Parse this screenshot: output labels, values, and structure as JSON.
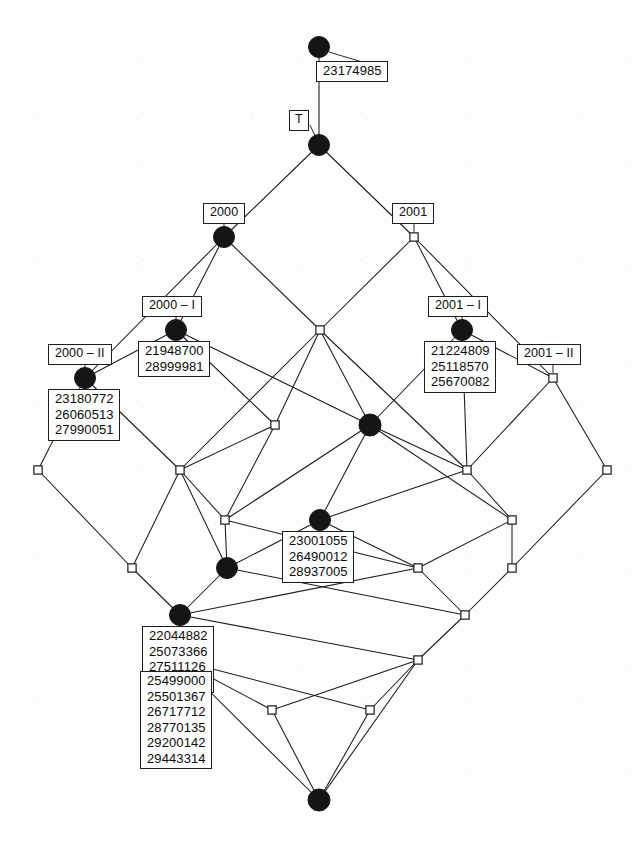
{
  "diagram": {
    "kind": "concept-lattice-hasse-diagram",
    "width": 637,
    "height": 848,
    "colors": {
      "background": "#fdfdfd",
      "edge": "#1a1a1a",
      "node_filled": "#151515",
      "node_open": "#ffffff",
      "label_border": "#1d1d1d",
      "label_text": "#0b0b0b"
    }
  },
  "labels": {
    "top_object": "23174985",
    "top_attribute": "T",
    "attr_2000": "2000",
    "attr_2001": "2001",
    "attr_2000_I": "2000 – I",
    "attr_2000_II": "2000 – II",
    "attr_2001_I": "2001 – I",
    "attr_2001_II": "2001 – II",
    "obj_2000_I": "21948700\n28999981",
    "obj_2000_II": "23180772\n26060513\n27990051",
    "obj_2001_I": "21224809\n25118570\n25670082",
    "obj_center": "23001055\n26490012\n28937005",
    "obj_lower_left": "22044882\n25073366\n27511126\n28853107",
    "obj_bottom_left": "25499000\n25501367\n26717712\n28770135\n29200142\n29443314"
  },
  "nodes": [
    {
      "id": "n-top",
      "x": 319,
      "y": 47,
      "style": "filled",
      "r": 10.5
    },
    {
      "id": "n-unit",
      "x": 319,
      "y": 145,
      "style": "filled",
      "r": 10.5
    },
    {
      "id": "n-2000",
      "x": 224,
      "y": 237,
      "style": "filled",
      "r": 10.5
    },
    {
      "id": "n-2001",
      "x": 414,
      "y": 237,
      "style": "open",
      "r": 5.0
    },
    {
      "id": "n-2000-I",
      "x": 176,
      "y": 330,
      "style": "filled",
      "r": 10.5
    },
    {
      "id": "n-mid-a",
      "x": 320,
      "y": 330,
      "style": "open",
      "r": 5.0
    },
    {
      "id": "n-2001-I",
      "x": 462,
      "y": 330,
      "style": "filled",
      "r": 10.5
    },
    {
      "id": "n-2000-II",
      "x": 85,
      "y": 378,
      "style": "filled",
      "r": 10.5
    },
    {
      "id": "n-2001-II",
      "x": 553,
      "y": 378,
      "style": "open",
      "r": 5.0
    },
    {
      "id": "n-r4-a",
      "x": 275,
      "y": 425,
      "style": "open",
      "r": 5.0
    },
    {
      "id": "n-r4-b",
      "x": 370,
      "y": 425,
      "style": "filled",
      "r": 11.0
    },
    {
      "id": "n-r5-a",
      "x": 38,
      "y": 470,
      "style": "open",
      "r": 5.0
    },
    {
      "id": "n-r5-b",
      "x": 180,
      "y": 470,
      "style": "open",
      "r": 5.0
    },
    {
      "id": "n-r5-c",
      "x": 467,
      "y": 470,
      "style": "open",
      "r": 5.0
    },
    {
      "id": "n-r5-d",
      "x": 607,
      "y": 470,
      "style": "open",
      "r": 5.0
    },
    {
      "id": "n-r6-a",
      "x": 225,
      "y": 520,
      "style": "open",
      "r": 5.0
    },
    {
      "id": "n-r6-b",
      "x": 320,
      "y": 520,
      "style": "filled",
      "r": 10.5
    },
    {
      "id": "n-r6-c",
      "x": 512,
      "y": 520,
      "style": "open",
      "r": 5.0
    },
    {
      "id": "n-r7-a",
      "x": 132,
      "y": 568,
      "style": "open",
      "r": 5.0
    },
    {
      "id": "n-r7-b",
      "x": 227,
      "y": 568,
      "style": "filled",
      "r": 10.5
    },
    {
      "id": "n-r7-c",
      "x": 418,
      "y": 568,
      "style": "open",
      "r": 5.0
    },
    {
      "id": "n-r7-d",
      "x": 512,
      "y": 568,
      "style": "open",
      "r": 5.0
    },
    {
      "id": "n-r8-a",
      "x": 180,
      "y": 615,
      "style": "filled",
      "r": 10.5
    },
    {
      "id": "n-r8-b",
      "x": 465,
      "y": 615,
      "style": "open",
      "r": 5.0
    },
    {
      "id": "n-r9-a",
      "x": 178,
      "y": 660,
      "style": "filled",
      "r": 10.5
    },
    {
      "id": "n-r9-b",
      "x": 418,
      "y": 660,
      "style": "open",
      "r": 5.0
    },
    {
      "id": "n-r10-a",
      "x": 272,
      "y": 710,
      "style": "open",
      "r": 5.0
    },
    {
      "id": "n-r10-b",
      "x": 370,
      "y": 710,
      "style": "open",
      "r": 5.0
    },
    {
      "id": "n-bottom",
      "x": 319,
      "y": 800,
      "style": "filled",
      "r": 11.0
    }
  ],
  "edges": [
    [
      "n-top",
      "n-unit"
    ],
    [
      "n-unit",
      "n-2000"
    ],
    [
      "n-unit",
      "n-2001"
    ],
    [
      "n-2000",
      "n-2000-I"
    ],
    [
      "n-2000",
      "n-2000-II"
    ],
    [
      "n-2000",
      "n-mid-a"
    ],
    [
      "n-2001",
      "n-mid-a"
    ],
    [
      "n-2001",
      "n-2001-I"
    ],
    [
      "n-2001",
      "n-2001-II"
    ],
    [
      "n-2000-I",
      "n-2000-II"
    ],
    [
      "n-2000-I",
      "n-r4-a"
    ],
    [
      "n-2000-I",
      "n-r4-b"
    ],
    [
      "n-mid-a",
      "n-r4-a"
    ],
    [
      "n-mid-a",
      "n-r4-b"
    ],
    [
      "n-mid-a",
      "n-r5-b"
    ],
    [
      "n-mid-a",
      "n-r5-c"
    ],
    [
      "n-2001-I",
      "n-2001-II"
    ],
    [
      "n-2001-I",
      "n-r4-b"
    ],
    [
      "n-2001-I",
      "n-r5-c"
    ],
    [
      "n-2000-II",
      "n-r5-a"
    ],
    [
      "n-2000-II",
      "n-r5-b"
    ],
    [
      "n-2001-II",
      "n-r5-c"
    ],
    [
      "n-2001-II",
      "n-r5-d"
    ],
    [
      "n-r4-a",
      "n-r5-b"
    ],
    [
      "n-r4-a",
      "n-r6-a"
    ],
    [
      "n-r4-b",
      "n-r6-a"
    ],
    [
      "n-r4-b",
      "n-r6-b"
    ],
    [
      "n-r4-b",
      "n-r5-c"
    ],
    [
      "n-r4-b",
      "n-r6-c"
    ],
    [
      "n-r5-a",
      "n-r7-a"
    ],
    [
      "n-r5-b",
      "n-r6-a"
    ],
    [
      "n-r5-b",
      "n-r7-a"
    ],
    [
      "n-r5-b",
      "n-r7-b"
    ],
    [
      "n-r5-c",
      "n-r6-b"
    ],
    [
      "n-r5-c",
      "n-r6-c"
    ],
    [
      "n-r5-d",
      "n-r7-d"
    ],
    [
      "n-r6-a",
      "n-r7-b"
    ],
    [
      "n-r6-a",
      "n-r7-c"
    ],
    [
      "n-r6-b",
      "n-r7-b"
    ],
    [
      "n-r6-b",
      "n-r7-c"
    ],
    [
      "n-r6-c",
      "n-r7-c"
    ],
    [
      "n-r6-c",
      "n-r7-d"
    ],
    [
      "n-r7-a",
      "n-r8-a"
    ],
    [
      "n-r7-b",
      "n-r8-a"
    ],
    [
      "n-r7-b",
      "n-r8-b"
    ],
    [
      "n-r7-c",
      "n-r8-a"
    ],
    [
      "n-r7-c",
      "n-r8-b"
    ],
    [
      "n-r7-d",
      "n-r8-b"
    ],
    [
      "n-r8-a",
      "n-r9-a"
    ],
    [
      "n-r8-a",
      "n-r9-b"
    ],
    [
      "n-r8-b",
      "n-r9-b"
    ],
    [
      "n-r9-a",
      "n-r10-a"
    ],
    [
      "n-r9-a",
      "n-r10-b"
    ],
    [
      "n-r9-b",
      "n-r10-a"
    ],
    [
      "n-r9-b",
      "n-r10-b"
    ],
    [
      "n-r9-a",
      "n-bottom"
    ],
    [
      "n-r10-a",
      "n-bottom"
    ],
    [
      "n-r10-b",
      "n-bottom"
    ],
    [
      "n-r9-b",
      "n-bottom"
    ]
  ],
  "label_boxes": [
    {
      "id": "lb-top-object",
      "text_key": "top_object",
      "kind": "obj",
      "x": 316,
      "y": 61,
      "leader_from": [
        329,
        52
      ],
      "leader_to": [
        382,
        68
      ]
    },
    {
      "id": "lb-top-attr",
      "text_key": "top_attribute",
      "kind": "top",
      "x": 289,
      "y": 110,
      "leader_from": [
        310,
        125
      ],
      "leader_to": [
        316,
        138
      ]
    },
    {
      "id": "lb-2000",
      "text_key": "attr_2000",
      "kind": "attr",
      "x": 203,
      "y": 203,
      "leader_from": [
        224,
        222
      ],
      "leader_to": [
        224,
        228
      ]
    },
    {
      "id": "lb-2001",
      "text_key": "attr_2001",
      "kind": "attr",
      "x": 392,
      "y": 203,
      "leader_from": [
        414,
        222
      ],
      "leader_to": [
        414,
        232
      ]
    },
    {
      "id": "lb-2000-I",
      "text_key": "attr_2000_I",
      "kind": "attr",
      "x": 142,
      "y": 296,
      "leader_from": [
        176,
        315
      ],
      "leader_to": [
        176,
        321
      ]
    },
    {
      "id": "lb-2000-I-obj",
      "text_key": "obj_2000_I",
      "kind": "obj",
      "x": 138,
      "y": 341,
      "leader_from": [
        176,
        339
      ],
      "leader_to": [
        176,
        344
      ]
    },
    {
      "id": "lb-2001-I",
      "text_key": "attr_2001_I",
      "kind": "attr",
      "x": 428,
      "y": 296,
      "leader_from": [
        462,
        315
      ],
      "leader_to": [
        462,
        321
      ]
    },
    {
      "id": "lb-2001-I-obj",
      "text_key": "obj_2001_I",
      "kind": "obj",
      "x": 424,
      "y": 341,
      "leader_from": [
        462,
        339
      ],
      "leader_to": [
        462,
        344
      ]
    },
    {
      "id": "lb-2000-II",
      "text_key": "attr_2000_II",
      "kind": "attr",
      "x": 48,
      "y": 344,
      "leader_from": [
        85,
        363
      ],
      "leader_to": [
        85,
        369
      ]
    },
    {
      "id": "lb-2000-II-obj",
      "text_key": "obj_2000_II",
      "kind": "obj",
      "x": 48,
      "y": 389,
      "leader_from": [
        85,
        387
      ],
      "leader_to": [
        85,
        392
      ]
    },
    {
      "id": "lb-2001-II",
      "text_key": "attr_2001_II",
      "kind": "attr",
      "x": 517,
      "y": 344,
      "leader_from": [
        553,
        363
      ],
      "leader_to": [
        553,
        373
      ]
    },
    {
      "id": "lb-center-obj",
      "text_key": "obj_center",
      "kind": "obj",
      "x": 282,
      "y": 531,
      "leader_from": [
        320,
        529
      ],
      "leader_to": [
        320,
        534
      ]
    },
    {
      "id": "lb-lower-obj",
      "text_key": "obj_lower_left",
      "kind": "obj",
      "x": 142,
      "y": 626,
      "leader_from": [
        180,
        624
      ],
      "leader_to": [
        180,
        629
      ]
    },
    {
      "id": "lb-bottom-obj",
      "text_key": "obj_bottom_left",
      "kind": "obj",
      "x": 140,
      "y": 671,
      "leader_from": [
        178,
        669
      ],
      "leader_to": [
        178,
        674
      ]
    }
  ]
}
